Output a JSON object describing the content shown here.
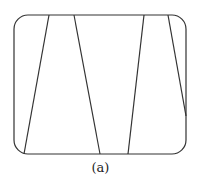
{
  "figure": {
    "caption": "(a)",
    "frame": {
      "x": 14,
      "y": 15,
      "width": 172,
      "height": 139,
      "corner_radius": 14
    },
    "stroke_color": "#333333",
    "lines": [
      {
        "x1": 49,
        "y1": 15,
        "x2": 24,
        "y2": 154
      },
      {
        "x1": 74,
        "y1": 15,
        "x2": 100,
        "y2": 154
      },
      {
        "x1": 144,
        "y1": 15,
        "x2": 128,
        "y2": 154
      },
      {
        "x1": 168,
        "y1": 15,
        "x2": 186,
        "y2": 116
      }
    ]
  }
}
